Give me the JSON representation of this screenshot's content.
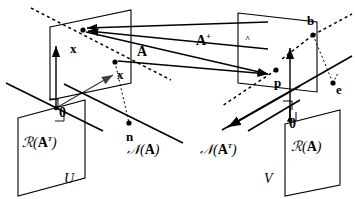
{
  "figure": {
    "type": "linear-algebra-subspace-diagram",
    "background": "#ffffff",
    "ink": "#000000"
  },
  "spaces": {
    "left": {
      "name": "U",
      "label": "U",
      "row_space": {
        "label_prefix": "ℛ(",
        "label_arg": "A",
        "label_sup": "T",
        "label_suffix": ")",
        "full": "ℛ(Aᵀ)"
      },
      "null_space": {
        "label_prefix": "𝒩(",
        "label_arg": "A",
        "label_suffix": ")",
        "full": "𝒩(A)"
      },
      "origin": "0"
    },
    "right": {
      "name": "V",
      "label": "V",
      "column_space": {
        "label_prefix": "ℛ(",
        "label_arg": "A",
        "label_suffix": ")",
        "full": "ℛ(A)"
      },
      "left_null_space": {
        "label_prefix": "𝒩(",
        "label_arg": "A",
        "label_sup": "T",
        "label_suffix": ")",
        "full": "𝒩(Aᵀ)"
      },
      "origin": "0"
    }
  },
  "points": [
    {
      "id": "x-hat",
      "label": "x",
      "mark": "^",
      "space": "U",
      "note": "minimum-norm solution in row space"
    },
    {
      "id": "x",
      "label": "x",
      "mark": "",
      "space": "U",
      "note": "general solution"
    },
    {
      "id": "n",
      "label": "n",
      "mark": "",
      "space": "U",
      "note": "null space component"
    },
    {
      "id": "p",
      "label": "p",
      "mark": "",
      "space": "V",
      "note": "projection onto column space"
    },
    {
      "id": "b",
      "label": "b",
      "mark": "",
      "space": "V",
      "note": "data vector"
    },
    {
      "id": "e",
      "label": "e",
      "mark": "",
      "space": "V",
      "note": "error / residual"
    }
  ],
  "maps": [
    {
      "id": "A",
      "label": "A",
      "sup": "",
      "direction": "U-to-V",
      "note": "forward map"
    },
    {
      "id": "Aplus",
      "label": "A",
      "sup": "+",
      "direction": "V-to-U",
      "note": "pseudoinverse map"
    }
  ],
  "labels": {
    "x_hat": "x",
    "x_hat_mark": "^",
    "x": "x",
    "n": "n",
    "p": "p",
    "b": "b",
    "e": "e",
    "zero_left": "0",
    "zero_right": "0",
    "A": "A",
    "A_plus": "A",
    "A_plus_sup": "+",
    "U": "U",
    "V": "V",
    "R_AT_open": "ℛ(",
    "R_AT_A": "A",
    "R_AT_sup": "T",
    "R_AT_close": ")",
    "N_A_open": "𝒩(",
    "N_A_A": "A",
    "N_A_close": ")",
    "N_AT_open": "𝒩(",
    "N_AT_A": "A",
    "N_AT_sup": "T",
    "N_AT_close": ")",
    "R_A_open": "ℛ(",
    "R_A_A": "A",
    "R_A_close": ")"
  }
}
